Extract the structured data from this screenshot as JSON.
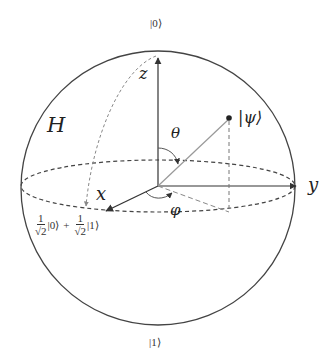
{
  "diagram": {
    "type": "bloch-sphere",
    "labels": {
      "north_pole": "|0⟩",
      "south_pole": "|1⟩",
      "z_axis": "z",
      "x_axis": "x",
      "y_axis": "y",
      "hadamard": "H",
      "theta": "θ",
      "phi": "φ",
      "state": "|ψ⟩",
      "superposition": {
        "coef1_num": "1",
        "coef1_den": "√2",
        "ket1": "|0⟩",
        "plus": "+",
        "coef2_num": "1",
        "coef2_den": "√2",
        "ket2": "|1⟩"
      }
    },
    "colors": {
      "line": "#333333",
      "vector": "#999999",
      "dashed": "#444444",
      "arc": "#888888"
    }
  }
}
